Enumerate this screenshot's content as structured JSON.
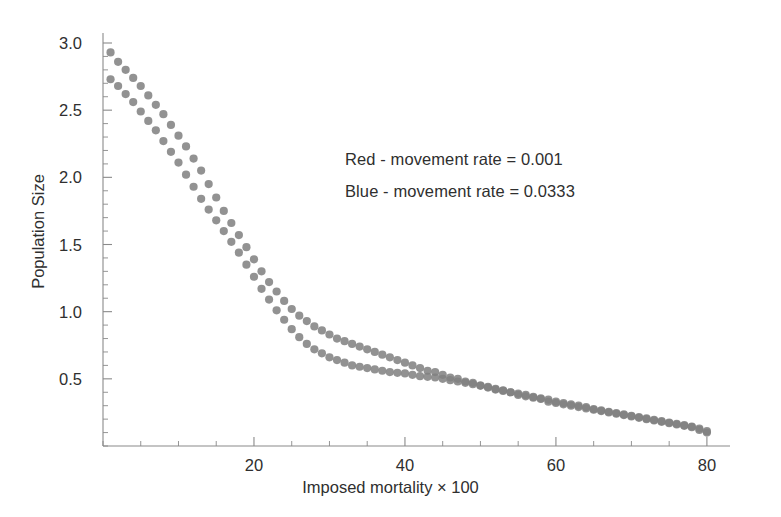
{
  "chart_data": {
    "type": "scatter",
    "title": "",
    "xlabel": "Imposed mortality × 100",
    "ylabel": "Population Size",
    "xlim": [
      0,
      82
    ],
    "ylim": [
      0,
      3.1
    ],
    "xticks": [
      20,
      40,
      60,
      80
    ],
    "xticklabels": [
      "20",
      "40",
      "60",
      "80"
    ],
    "yticks": [
      0.5,
      1.0,
      1.5,
      2.0,
      2.5,
      3.0
    ],
    "yticklabels": [
      "0.5",
      "1.0",
      "1.5",
      "2.0",
      "2.5",
      "3.0"
    ],
    "x_minor_step": 5,
    "y_minor_step": 0.1,
    "grid": false,
    "legend_position": "upper-center-right",
    "marker": "filled-circle",
    "marker_size_px": 7,
    "series": [
      {
        "name": "Red - movement rate = 0.001",
        "legend_label": "Red - movement rate = 0.001",
        "color_name": "Red",
        "color": "#808080",
        "movement_rate": 0.001,
        "points": [
          [
            1.0,
            2.93
          ],
          [
            2.0,
            2.86
          ],
          [
            3.0,
            2.8
          ],
          [
            4.0,
            2.74
          ],
          [
            5.0,
            2.68
          ],
          [
            6.0,
            2.61
          ],
          [
            7.0,
            2.54
          ],
          [
            8.0,
            2.47
          ],
          [
            9.0,
            2.39
          ],
          [
            10.0,
            2.31
          ],
          [
            11.0,
            2.23
          ],
          [
            12.0,
            2.14
          ],
          [
            13.0,
            2.05
          ],
          [
            14.0,
            1.95
          ],
          [
            15.0,
            1.85
          ],
          [
            16.0,
            1.75
          ],
          [
            17.0,
            1.66
          ],
          [
            18.0,
            1.57
          ],
          [
            19.0,
            1.48
          ],
          [
            20.0,
            1.39
          ],
          [
            21.0,
            1.3
          ],
          [
            22.0,
            1.22
          ],
          [
            23.0,
            1.15
          ],
          [
            24.0,
            1.08
          ],
          [
            25.0,
            1.02
          ],
          [
            26.0,
            0.97
          ],
          [
            27.0,
            0.93
          ],
          [
            28.0,
            0.89
          ],
          [
            29.0,
            0.86
          ],
          [
            30.0,
            0.83
          ],
          [
            31.0,
            0.8
          ],
          [
            32.0,
            0.78
          ],
          [
            33.0,
            0.76
          ],
          [
            34.0,
            0.74
          ],
          [
            35.0,
            0.72
          ],
          [
            36.0,
            0.7
          ],
          [
            37.0,
            0.68
          ],
          [
            38.0,
            0.66
          ],
          [
            39.0,
            0.64
          ],
          [
            40.0,
            0.62
          ],
          [
            41.0,
            0.6
          ],
          [
            42.0,
            0.58
          ],
          [
            43.0,
            0.56
          ],
          [
            44.0,
            0.55
          ],
          [
            45.0,
            0.53
          ],
          [
            46.0,
            0.51
          ],
          [
            47.0,
            0.5
          ],
          [
            48.0,
            0.48
          ],
          [
            49.0,
            0.47
          ],
          [
            50.0,
            0.45
          ],
          [
            51.0,
            0.44
          ],
          [
            52.0,
            0.42
          ],
          [
            53.0,
            0.41
          ],
          [
            54.0,
            0.4
          ],
          [
            55.0,
            0.38
          ],
          [
            56.0,
            0.37
          ],
          [
            57.0,
            0.36
          ],
          [
            58.0,
            0.35
          ],
          [
            59.0,
            0.33
          ],
          [
            60.0,
            0.32
          ],
          [
            61.0,
            0.31
          ],
          [
            62.0,
            0.3
          ],
          [
            63.0,
            0.29
          ],
          [
            64.0,
            0.28
          ],
          [
            65.0,
            0.27
          ],
          [
            66.0,
            0.26
          ],
          [
            67.0,
            0.25
          ],
          [
            68.0,
            0.24
          ],
          [
            69.0,
            0.23
          ],
          [
            70.0,
            0.22
          ],
          [
            71.0,
            0.21
          ],
          [
            72.0,
            0.2
          ],
          [
            73.0,
            0.19
          ],
          [
            74.0,
            0.18
          ],
          [
            75.0,
            0.17
          ],
          [
            76.0,
            0.16
          ],
          [
            77.0,
            0.15
          ],
          [
            78.0,
            0.14
          ],
          [
            79.0,
            0.12
          ],
          [
            80.0,
            0.1
          ]
        ]
      },
      {
        "name": "Blue - movement rate = 0.0333",
        "legend_label": "Blue - movement rate = 0.0333",
        "color_name": "Blue",
        "color": "#808080",
        "movement_rate": 0.0333,
        "points": [
          [
            1.0,
            2.73
          ],
          [
            2.0,
            2.68
          ],
          [
            3.0,
            2.62
          ],
          [
            4.0,
            2.56
          ],
          [
            5.0,
            2.49
          ],
          [
            6.0,
            2.42
          ],
          [
            7.0,
            2.35
          ],
          [
            8.0,
            2.27
          ],
          [
            9.0,
            2.19
          ],
          [
            10.0,
            2.11
          ],
          [
            11.0,
            2.02
          ],
          [
            12.0,
            1.93
          ],
          [
            13.0,
            1.84
          ],
          [
            14.0,
            1.76
          ],
          [
            15.0,
            1.68
          ],
          [
            16.0,
            1.6
          ],
          [
            17.0,
            1.52
          ],
          [
            18.0,
            1.44
          ],
          [
            19.0,
            1.35
          ],
          [
            20.0,
            1.26
          ],
          [
            21.0,
            1.17
          ],
          [
            22.0,
            1.09
          ],
          [
            23.0,
            1.01
          ],
          [
            24.0,
            0.94
          ],
          [
            25.0,
            0.87
          ],
          [
            26.0,
            0.81
          ],
          [
            27.0,
            0.76
          ],
          [
            28.0,
            0.72
          ],
          [
            29.0,
            0.69
          ],
          [
            30.0,
            0.66
          ],
          [
            31.0,
            0.64
          ],
          [
            32.0,
            0.62
          ],
          [
            33.0,
            0.6
          ],
          [
            34.0,
            0.59
          ],
          [
            35.0,
            0.58
          ],
          [
            36.0,
            0.57
          ],
          [
            37.0,
            0.56
          ],
          [
            38.0,
            0.55
          ],
          [
            39.0,
            0.545
          ],
          [
            40.0,
            0.54
          ],
          [
            41.0,
            0.53
          ],
          [
            42.0,
            0.52
          ],
          [
            43.0,
            0.515
          ],
          [
            44.0,
            0.51
          ],
          [
            45.0,
            0.5
          ],
          [
            46.0,
            0.49
          ],
          [
            47.0,
            0.48
          ],
          [
            48.0,
            0.47
          ],
          [
            49.0,
            0.46
          ],
          [
            50.0,
            0.45
          ],
          [
            51.0,
            0.435
          ],
          [
            52.0,
            0.425
          ],
          [
            53.0,
            0.415
          ],
          [
            54.0,
            0.4
          ],
          [
            55.0,
            0.39
          ],
          [
            56.0,
            0.38
          ],
          [
            57.0,
            0.365
          ],
          [
            58.0,
            0.355
          ],
          [
            59.0,
            0.345
          ],
          [
            60.0,
            0.33
          ],
          [
            61.0,
            0.32
          ],
          [
            62.0,
            0.31
          ],
          [
            63.0,
            0.3
          ],
          [
            64.0,
            0.29
          ],
          [
            65.0,
            0.275
          ],
          [
            66.0,
            0.265
          ],
          [
            67.0,
            0.255
          ],
          [
            68.0,
            0.245
          ],
          [
            69.0,
            0.235
          ],
          [
            70.0,
            0.225
          ],
          [
            71.0,
            0.215
          ],
          [
            72.0,
            0.205
          ],
          [
            73.0,
            0.195
          ],
          [
            74.0,
            0.185
          ],
          [
            75.0,
            0.175
          ],
          [
            76.0,
            0.165
          ],
          [
            77.0,
            0.155
          ],
          [
            78.0,
            0.145
          ],
          [
            79.0,
            0.13
          ],
          [
            80.0,
            0.11
          ]
        ]
      }
    ]
  },
  "axes": {
    "x_axis_color": "#8a8a8a",
    "y_axis_color": "#8a8a8a"
  },
  "legend": {
    "red_text": "Red - movement rate = 0.001",
    "blue_text": "Blue - movement rate = 0.0333"
  },
  "labels": {
    "x_title": "Imposed mortality × 100",
    "y_title": "Population Size"
  }
}
